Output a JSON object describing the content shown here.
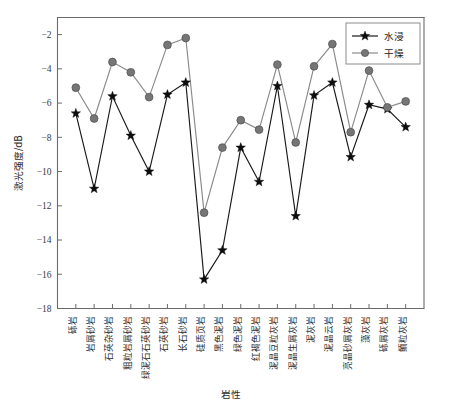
{
  "chart_data": {
    "type": "line",
    "title": "",
    "xlabel": "岩性",
    "ylabel": "激光强度/dB",
    "ylim": [
      -18,
      -1
    ],
    "yticks": [
      -2,
      -4,
      -6,
      -8,
      -10,
      -12,
      -14,
      -16,
      -18
    ],
    "grid": false,
    "legend_position": "top-right",
    "categories": [
      "砾岩",
      "岩屑砂岩",
      "石英杂砂岩",
      "粗粒岩屑砂岩",
      "绿泥石石英砂岩",
      "石英砂岩",
      "长石砂岩",
      "硅质页岩",
      "黑色泥岩",
      "绿色泥岩",
      "红褐色泥岩",
      "泥晶豆粒灰岩",
      "泥晶生屑灰岩",
      "泥灰岩",
      "泥晶云岩",
      "亮晶砂屑灰岩",
      "藻灰岩",
      "砾屑灰岩",
      "鲕粒灰岩"
    ],
    "series": [
      {
        "name": "水浸",
        "color": "#1a1a1a",
        "marker": "star",
        "values": [
          -6.6,
          -11.0,
          -5.6,
          -7.9,
          -10.0,
          -5.5,
          -4.8,
          -16.3,
          -14.6,
          -8.6,
          -10.6,
          -5.0,
          -12.6,
          -5.55,
          -4.8,
          -9.15,
          -6.1,
          -6.35,
          -7.4
        ]
      },
      {
        "name": "干燥",
        "color": "#767676",
        "marker": "circle",
        "values": [
          -5.1,
          -6.9,
          -3.6,
          -4.2,
          -5.65,
          -2.6,
          -2.2,
          -12.4,
          -8.6,
          -7.0,
          -7.55,
          -3.75,
          -8.3,
          -3.85,
          -2.55,
          -7.7,
          -4.1,
          -6.25,
          -5.9
        ]
      }
    ]
  },
  "axis": {
    "y_title": "激光强度/dB",
    "x_title": "岩性"
  },
  "legend": {
    "entries": [
      {
        "label": "水浸"
      },
      {
        "label": "干燥"
      }
    ]
  }
}
